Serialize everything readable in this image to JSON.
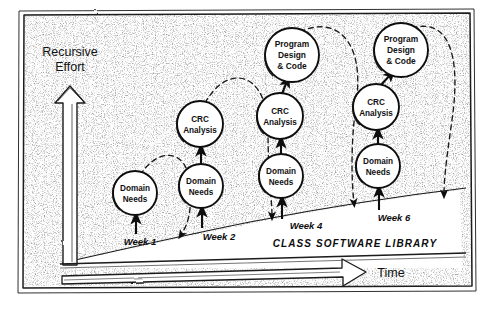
{
  "figure": {
    "style": "hand-drawn pencil sketch, black ink on white paper with speckled texture",
    "frame": {
      "border_color": "#1a1a1a"
    }
  },
  "axes": {
    "y": {
      "label_line1": "Recursive",
      "label_line2": "Effort",
      "icon": "up-block-arrow-icon",
      "direction": "up"
    },
    "x": {
      "label": "Time",
      "icon": "right-block-arrow-icon",
      "direction": "right"
    }
  },
  "library_band": {
    "label": "CLASS SOFTWARE LIBRARY"
  },
  "week_ticks": [
    {
      "id": "week-1",
      "label": "Week 1",
      "x": 140,
      "y": 242
    },
    {
      "id": "week-2",
      "label": "Week 2",
      "x": 219,
      "y": 238
    },
    {
      "id": "week-4",
      "label": "Week 4",
      "x": 306,
      "y": 228
    },
    {
      "id": "week-6",
      "label": "Week 6",
      "x": 394,
      "y": 221
    }
  ],
  "columns": [
    {
      "id": "column-week-1",
      "week": "Week 1",
      "nodes": [
        {
          "id": "domain-needs-1",
          "lines": [
            "Domain",
            "Needs"
          ],
          "cx": 135,
          "cy": 193,
          "r": 22,
          "font_size": 8.2
        }
      ]
    },
    {
      "id": "column-week-2",
      "week": "Week 2",
      "nodes": [
        {
          "id": "domain-needs-2",
          "lines": [
            "Domain",
            "Needs"
          ],
          "cx": 201,
          "cy": 186,
          "r": 22,
          "font_size": 8.2
        },
        {
          "id": "crc-analysis-2",
          "lines": [
            "CRC",
            "Analysis"
          ],
          "cx": 200,
          "cy": 124,
          "r": 23,
          "font_size": 8.2
        }
      ]
    },
    {
      "id": "column-week-4",
      "week": "Week 4",
      "nodes": [
        {
          "id": "domain-needs-4",
          "lines": [
            "Domain",
            "Needs"
          ],
          "cx": 281,
          "cy": 176,
          "r": 22,
          "font_size": 8.2
        },
        {
          "id": "crc-analysis-4",
          "lines": [
            "CRC",
            "Analysis"
          ],
          "cx": 280,
          "cy": 116,
          "r": 23,
          "font_size": 8.2
        },
        {
          "id": "program-design-code-4",
          "lines": [
            "Program",
            "Design",
            "& Code"
          ],
          "cx": 292,
          "cy": 55,
          "r": 27,
          "font_size": 8.4
        }
      ]
    },
    {
      "id": "column-week-6",
      "week": "Week 6",
      "nodes": [
        {
          "id": "domain-needs-6",
          "lines": [
            "Domain",
            "Needs"
          ],
          "cx": 378,
          "cy": 166,
          "r": 22,
          "font_size": 8.2
        },
        {
          "id": "crc-analysis-6",
          "lines": [
            "CRC",
            "Analysis"
          ],
          "cx": 376,
          "cy": 107,
          "r": 23,
          "font_size": 8.2
        },
        {
          "id": "program-design-code-6",
          "lines": [
            "Program",
            "Design",
            "& Code"
          ],
          "cx": 401,
          "cy": 50,
          "r": 27,
          "font_size": 8.4
        }
      ]
    }
  ],
  "solid_arrows": [
    {
      "id": "arrow-base-to-dn1",
      "x1": 136,
      "y1": 232,
      "x2": 136,
      "y2": 217
    },
    {
      "id": "arrow-base-to-dn2",
      "x1": 202,
      "y1": 226,
      "x2": 202,
      "y2": 210
    },
    {
      "id": "arrow-dn2-to-crc2",
      "x1": 201,
      "y1": 164,
      "x2": 201,
      "y2": 149
    },
    {
      "id": "arrow-base-to-dn4",
      "x1": 282,
      "y1": 217,
      "x2": 282,
      "y2": 200
    },
    {
      "id": "arrow-dn4-to-crc4",
      "x1": 281,
      "y1": 154,
      "x2": 281,
      "y2": 141
    },
    {
      "id": "arrow-crc4-to-pdc4",
      "x1": 283,
      "y1": 93,
      "x2": 288,
      "y2": 80
    },
    {
      "id": "arrow-base-to-dn6",
      "x1": 379,
      "y1": 208,
      "x2": 379,
      "y2": 190
    },
    {
      "id": "arrow-dn6-to-crc6",
      "x1": 378,
      "y1": 144,
      "x2": 378,
      "y2": 132
    },
    {
      "id": "arrow-crc6-to-pdc6",
      "x1": 382,
      "y1": 84,
      "x2": 392,
      "y2": 73
    }
  ],
  "dashed_feedback_arcs": [
    {
      "id": "feedback-arc-1",
      "from": "domain-needs-1",
      "to": "baseline-week-2"
    },
    {
      "id": "feedback-arc-2",
      "from": "crc-analysis-2",
      "to": "baseline-week-4"
    },
    {
      "id": "feedback-arc-3",
      "from": "program-design-code-4",
      "to": "baseline-week-6"
    },
    {
      "id": "feedback-arc-4",
      "from": "program-design-code-6",
      "to": "baseline-right"
    }
  ]
}
